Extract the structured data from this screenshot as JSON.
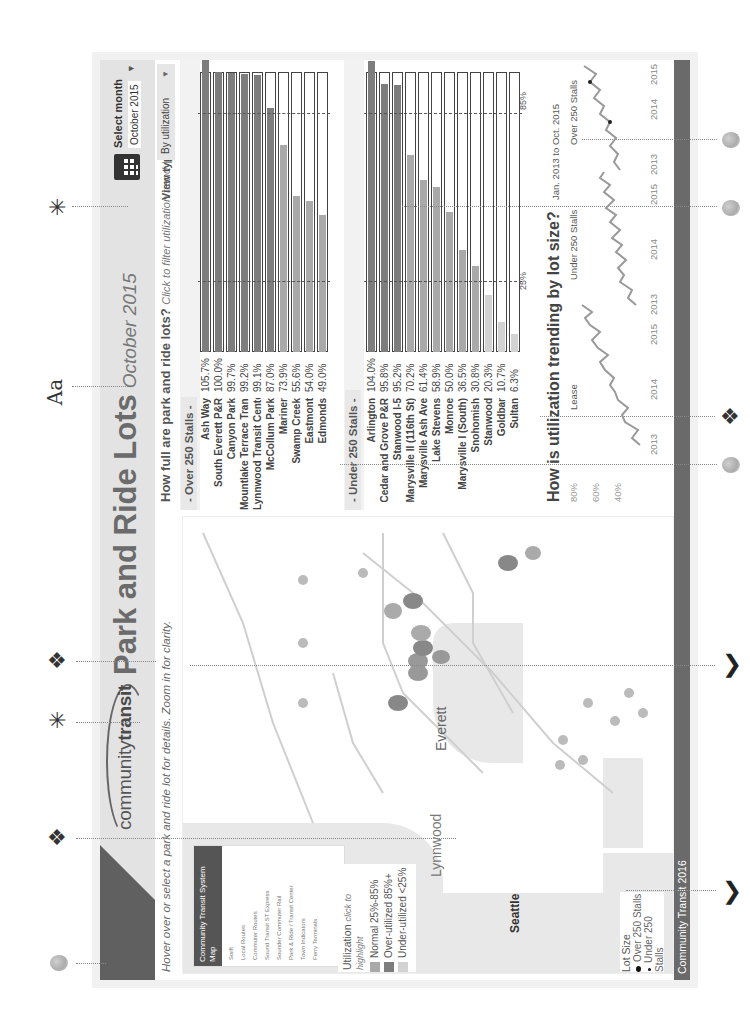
{
  "header": {
    "logo": {
      "part1": "community",
      "part2": "transit"
    },
    "title": "Park and Ride Lots",
    "title_date": "October 2015",
    "month_select": {
      "label": "Select month",
      "value": "October 2015"
    }
  },
  "subheader": {
    "map_hint": "Hover over or select a park and ride lot for details. Zoom in for clarity.",
    "question": "How full are park and ride lots?",
    "question_hint": "Click to filter utilization trend",
    "separator": "|",
    "view_type_label": "View type:",
    "view_type_value": "By utilization"
  },
  "map": {
    "legend_box": {
      "title": "Community Transit System Map",
      "items": [
        "Swift",
        "Local Routes",
        "Commuter Routes",
        "Sound Transit ST Express",
        "Sounder Commuter Rail",
        "Park & Ride / Transit Center",
        "Town Indicators",
        "Ferry Terminals",
        "Major Destinations"
      ]
    },
    "city_labels": [
      "Everett",
      "Lynnwood",
      "Seattle",
      "Mukilteo"
    ],
    "utilization_legend": {
      "title": "Utilization",
      "hint": "click to highlight",
      "items": [
        {
          "label": "Normal 25%-85%",
          "color": "#a9a9a9"
        },
        {
          "label": "Over-utilized 85%+",
          "color": "#7d7d7d"
        },
        {
          "label": "Under-utilized <25%",
          "color": "#d2d2d2"
        }
      ]
    },
    "lot_size_legend": {
      "title": "Lot Size",
      "items": [
        "Over 250 Stalls",
        "Under 250 Stalls"
      ]
    }
  },
  "over250": {
    "header": "- Over 250 Stalls -",
    "rows": [
      {
        "name": "Ash Way",
        "value": "105.7%",
        "pct": 105.7
      },
      {
        "name": "South Everett P&R",
        "value": "100.0%",
        "pct": 100.0
      },
      {
        "name": "Canyon Park",
        "value": "99.7%",
        "pct": 99.7
      },
      {
        "name": "Mountlake Terrace Transit Cent..",
        "value": "99.2%",
        "pct": 99.2
      },
      {
        "name": "Lynnwood Transit Center",
        "value": "99.1%",
        "pct": 99.1
      },
      {
        "name": "McCollum Park",
        "value": "87.0%",
        "pct": 87.0
      },
      {
        "name": "Mariner",
        "value": "73.9%",
        "pct": 73.9
      },
      {
        "name": "Swamp Creek",
        "value": "55.6%",
        "pct": 55.6
      },
      {
        "name": "Eastmont",
        "value": "54.0%",
        "pct": 54.0
      },
      {
        "name": "Edmonds",
        "value": "49.0%",
        "pct": 49.0
      }
    ]
  },
  "under250": {
    "header": "- Under 250 Stalls -",
    "rows": [
      {
        "name": "Arlington",
        "value": "104.0%",
        "pct": 104.0
      },
      {
        "name": "Cedar and Grove P&R",
        "value": "95.8%",
        "pct": 95.8
      },
      {
        "name": "Stanwood I-5",
        "value": "95.2%",
        "pct": 95.2
      },
      {
        "name": "Marysville II (116th St)",
        "value": "70.2%",
        "pct": 70.2
      },
      {
        "name": "Marysville Ash Ave",
        "value": "61.4%",
        "pct": 61.4
      },
      {
        "name": "Lake Stevens",
        "value": "58.9%",
        "pct": 58.9
      },
      {
        "name": "Monroe",
        "value": "50.0%",
        "pct": 50.0
      },
      {
        "name": "Marysville I (South)",
        "value": "36.5%",
        "pct": 36.5
      },
      {
        "name": "Snohomish",
        "value": "30.8%",
        "pct": 30.8
      },
      {
        "name": "Stanwood",
        "value": "20.3%",
        "pct": 20.3
      },
      {
        "name": "Goldbar",
        "value": "10.7%",
        "pct": 10.7
      },
      {
        "name": "Sultan",
        "value": "6.3%",
        "pct": 6.3
      }
    ],
    "ref_labels": {
      "low": "25%",
      "high": "85%"
    }
  },
  "trend": {
    "title": "How is utilization trending by lot size?",
    "range_label": "Jan. 2013 to Oct. 2015",
    "y_ticks": [
      "80%",
      "60%",
      "40%"
    ],
    "panels": [
      {
        "label": "Lease",
        "x_ticks": [
          "2013",
          "2014",
          "2015"
        ]
      },
      {
        "label": "Under 250 Stalls",
        "x_ticks": [
          "2013",
          "2014",
          "2015"
        ]
      },
      {
        "label": "Over 250 Stalls",
        "x_ticks": [
          "2013",
          "2014",
          "2015"
        ]
      }
    ]
  },
  "footer": {
    "text": "Community Transit 2016"
  },
  "annotations": {
    "text_icon": "Aa"
  },
  "colors": {
    "over": "#7d7d7d",
    "normal": "#a9a9a9",
    "under": "#d2d2d2",
    "header_dark": "#606060",
    "footer": "#6a6a6a"
  },
  "chart_data": [
    {
      "type": "bar",
      "title": "How full are park and ride lots? - Over 250 Stalls",
      "categories": [
        "Ash Way",
        "South Everett P&R",
        "Canyon Park",
        "Mountlake Terrace Transit Cent..",
        "Lynnwood Transit Center",
        "McCollum Park",
        "Mariner",
        "Swamp Creek",
        "Eastmont",
        "Edmonds"
      ],
      "values": [
        105.7,
        100.0,
        99.7,
        99.2,
        99.1,
        87.0,
        73.9,
        55.6,
        54.0,
        49.0
      ],
      "ylabel": "Utilization %",
      "reference_lines": [
        25,
        85
      ]
    },
    {
      "type": "bar",
      "title": "How full are park and ride lots? - Under 250 Stalls",
      "categories": [
        "Arlington",
        "Cedar and Grove P&R",
        "Stanwood I-5",
        "Marysville II (116th St)",
        "Marysville Ash Ave",
        "Lake Stevens",
        "Monroe",
        "Marysville I (South)",
        "Snohomish",
        "Stanwood",
        "Goldbar",
        "Sultan"
      ],
      "values": [
        104.0,
        95.8,
        95.2,
        70.2,
        61.4,
        58.9,
        50.0,
        36.5,
        30.8,
        20.3,
        10.7,
        6.3
      ],
      "ylabel": "Utilization %",
      "reference_lines": [
        25,
        85
      ]
    },
    {
      "type": "line",
      "title": "How is utilization trending by lot size?",
      "subtitle": "Jan. 2013 to Oct. 2015",
      "x": [
        "2013",
        "2014",
        "2015"
      ],
      "series": [
        {
          "name": "Lease",
          "values": [
            38,
            52,
            62
          ]
        },
        {
          "name": "Under 250 Stalls",
          "values": [
            58,
            64,
            66
          ]
        },
        {
          "name": "Over 250 Stalls",
          "values": [
            84,
            86,
            88
          ]
        }
      ],
      "yticks": [
        "40%",
        "60%",
        "80%"
      ]
    }
  ]
}
